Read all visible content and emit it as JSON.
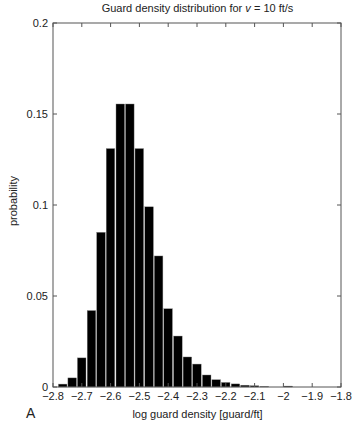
{
  "chart_data": {
    "type": "bar",
    "title": "Guard density distribution for v = 10 ft/s",
    "title_prefix": "Guard density distribution for ",
    "title_var": "v",
    "title_suffix": " = 10 ft/s",
    "xlabel": "log guard density [guard/ft]",
    "ylabel": "probability",
    "panel_label": "A",
    "xlim": [
      -2.8,
      -1.8
    ],
    "ylim": [
      0,
      0.2
    ],
    "xticks": [
      -2.8,
      -2.7,
      -2.6,
      -2.5,
      -2.4,
      -2.3,
      -2.2,
      -2.1,
      -2.0,
      -1.9,
      -1.8
    ],
    "xtick_labels": [
      "−2.8",
      "−2.7",
      "−2.6",
      "−2.5",
      "−2.4",
      "−2.3",
      "−2.2",
      "−2.1",
      "−2",
      "−1.9",
      "−1.8"
    ],
    "yticks": [
      0,
      0.05,
      0.1,
      0.15,
      0.2
    ],
    "ytick_labels": [
      "0",
      "0.05",
      "0.1",
      "0.15",
      "0.2"
    ],
    "grid": false,
    "bin_width": 0.0333,
    "bin_starts": [
      -2.783,
      -2.75,
      -2.717,
      -2.683,
      -2.65,
      -2.617,
      -2.583,
      -2.55,
      -2.517,
      -2.483,
      -2.45,
      -2.417,
      -2.383,
      -2.35,
      -2.317,
      -2.283,
      -2.25,
      -2.217,
      -2.183,
      -2.15,
      -2.117,
      -2.083,
      -2.0
    ],
    "values": [
      0.0016,
      0.005,
      0.016,
      0.042,
      0.085,
      0.131,
      0.1555,
      0.1555,
      0.131,
      0.099,
      0.072,
      0.043,
      0.028,
      0.0165,
      0.0126,
      0.0066,
      0.004,
      0.0025,
      0.0017,
      0.001,
      0.0007,
      0.0003,
      0.0005
    ],
    "bar_color": "#000000"
  }
}
